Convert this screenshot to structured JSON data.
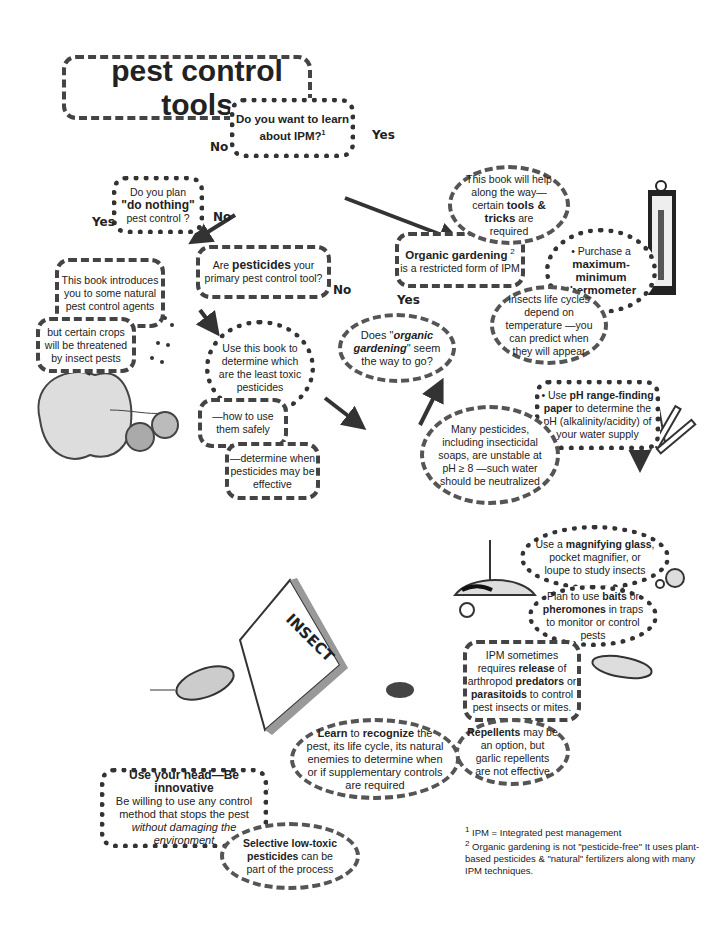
{
  "title": "pest control tools",
  "nodes": {
    "ipm_question": {
      "pre": "Do you want to learn about IPM?",
      "sup": "1"
    },
    "do_nothing": {
      "l1": "Do you plan",
      "bold": "\"do nothing\"",
      "l3": "pest control ?"
    },
    "natural_agents": "This book introduces you to some natural pest control agents",
    "crops_threatened": "but certain crops will be threatened by insect pests",
    "pesticides_primary": {
      "pre": "Are ",
      "bold": "pesticides",
      "post": " your primary pest control tool?"
    },
    "least_toxic": "Use this book to determine which are the least toxic pesticides",
    "use_safely": "—how to use them safely",
    "when_effective": "—determine when pesticides may be effective",
    "organic_question": {
      "pre": "Does \"",
      "bold": "organic gardening",
      "post": "\" seem the way to go?"
    },
    "organic_restricted": {
      "bold": "Organic gardening",
      "sup": "2",
      "post": "is a restricted form of IPM"
    },
    "tools_tricks": {
      "pre": "This book will help along the way— certain ",
      "bold": "tools & tricks",
      "post": " are required"
    },
    "thermometer": {
      "pre": "• Purchase a",
      "bold": "maximum-minimum thermometer"
    },
    "life_cycles": "Insects life cycles depend on temperature —you can predict when they will appear",
    "ph_paper": {
      "pre": "• Use ",
      "bold": "pH range-finding paper",
      "post": " to determine the pH (alkalinity/acidity) of your water supply"
    },
    "unstable_ph": "Many pesticides, including insecticidal soaps, are unstable at pH ≥ 8 —such water should be neutralized",
    "magnifying": {
      "pre": "Use a ",
      "bold": "magnifying glass",
      "post": ", pocket magnifier, or loupe to study insects"
    },
    "baits": {
      "pre": "Plan to use ",
      "bold1": "baits",
      "mid": " or ",
      "bold2": "pheromones",
      "post": " in traps to monitor or control pests"
    },
    "predators": {
      "a": "IPM sometimes requires ",
      "b1": "release",
      "c": " of arthropod ",
      "b2": "predators",
      "d": " or ",
      "b3": "parasitoids",
      "e": " to control pest insects or mites."
    },
    "repellents": {
      "bold": "Repellents",
      "post": " may be an option, but garlic repellents are not effective"
    },
    "recognize": {
      "b1": "Learn",
      "a": " to ",
      "b2": "recognize",
      "post": " the pest, its life cycle, its natural enemies to determine when or if supplementary controls are required"
    },
    "use_head": {
      "bold": "Use your head—Be innovative",
      "pre": "Be willing to use any control method that stops the pest ",
      "ital": "without damaging the environment"
    },
    "low_toxic": {
      "bold": "Selective low-toxic pesticides",
      "post": " can be part of the process"
    }
  },
  "labels": {
    "yes": "Yes",
    "no": "No"
  },
  "book_title": "INSECT",
  "footnotes": [
    {
      "num": "1",
      "text": "IPM = Integrated pest management"
    },
    {
      "num": "2",
      "text": "Organic gardening is not \"pesticide-free\" It uses plant-based pesticides & \"natural\" fertilizers along with many IPM techniques."
    }
  ]
}
